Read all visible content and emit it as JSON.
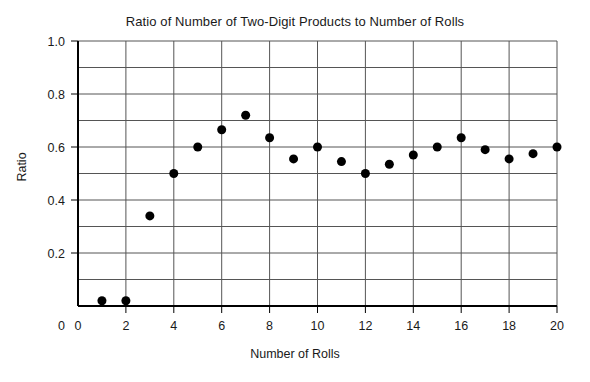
{
  "chart_data": {
    "type": "scatter",
    "title": "Ratio of Number of Two-Digit Products to Number of Rolls",
    "xlabel": "Number of Rolls",
    "ylabel": "Ratio",
    "xlim": [
      0,
      20
    ],
    "ylim": [
      0,
      1.0
    ],
    "grid": true,
    "legend": null,
    "x_ticks": [
      "0",
      "2",
      "4",
      "6",
      "8",
      "10",
      "12",
      "14",
      "16",
      "18",
      "20"
    ],
    "x_tick_values": [
      0,
      2,
      4,
      6,
      8,
      10,
      12,
      14,
      16,
      18,
      20
    ],
    "y_ticks": [
      "0",
      "0.2",
      "0.4",
      "0.6",
      "0.8",
      "1.0"
    ],
    "y_tick_values": [
      0,
      0.2,
      0.4,
      0.6,
      0.8,
      1.0
    ],
    "x_minor_step": 1,
    "y_minor_step": 0.1,
    "marker": "filled-circle",
    "marker_color": "#000000",
    "marker_radius": 4.5,
    "grid_color": "#555555",
    "axis_color": "#000000",
    "x": [
      1,
      2,
      3,
      4,
      5,
      6,
      7,
      8,
      9,
      10,
      11,
      12,
      13,
      14,
      15,
      16,
      17,
      18,
      19,
      20
    ],
    "values": [
      0.02,
      0.02,
      0.34,
      0.5,
      0.6,
      0.665,
      0.72,
      0.635,
      0.555,
      0.6,
      0.545,
      0.5,
      0.535,
      0.57,
      0.6,
      0.635,
      0.59,
      0.555,
      0.575,
      0.6
    ],
    "points": [
      {
        "x": 1,
        "y": 0.02
      },
      {
        "x": 2,
        "y": 0.02
      },
      {
        "x": 3,
        "y": 0.34
      },
      {
        "x": 4,
        "y": 0.5
      },
      {
        "x": 5,
        "y": 0.6
      },
      {
        "x": 6,
        "y": 0.665
      },
      {
        "x": 7,
        "y": 0.72
      },
      {
        "x": 8,
        "y": 0.635
      },
      {
        "x": 9,
        "y": 0.555
      },
      {
        "x": 10,
        "y": 0.6
      },
      {
        "x": 11,
        "y": 0.545
      },
      {
        "x": 12,
        "y": 0.5
      },
      {
        "x": 13,
        "y": 0.535
      },
      {
        "x": 14,
        "y": 0.57
      },
      {
        "x": 15,
        "y": 0.6
      },
      {
        "x": 16,
        "y": 0.635
      },
      {
        "x": 17,
        "y": 0.59
      },
      {
        "x": 18,
        "y": 0.555
      },
      {
        "x": 19,
        "y": 0.575
      },
      {
        "x": 20,
        "y": 0.6
      }
    ]
  },
  "plot_geometry": {
    "left": 78,
    "right": 557,
    "top": 41,
    "bottom": 306
  }
}
